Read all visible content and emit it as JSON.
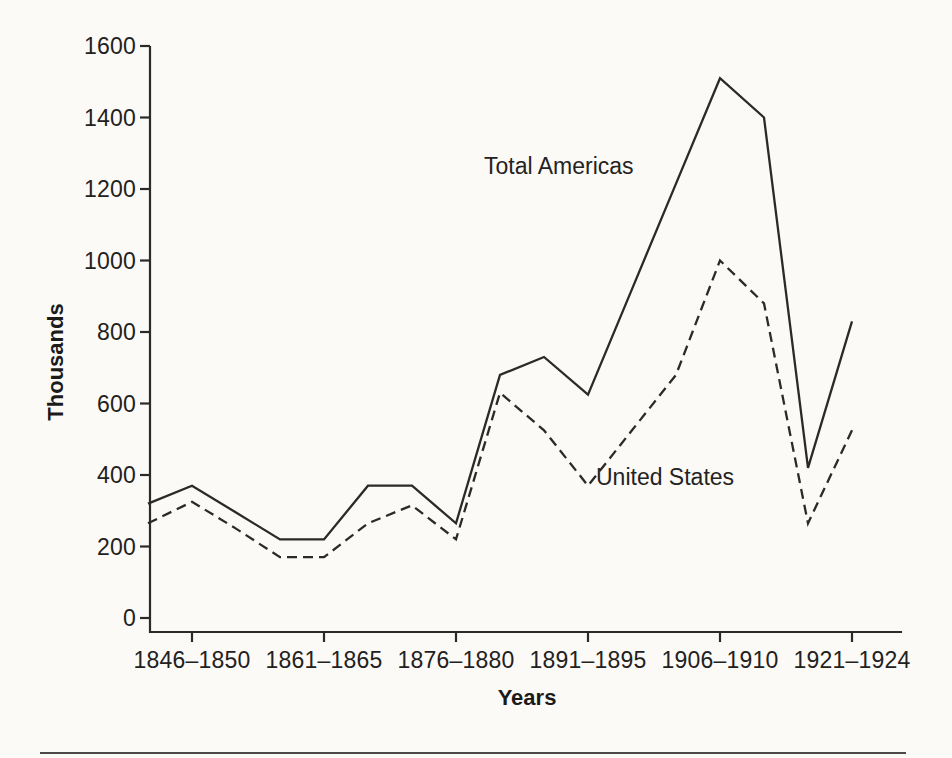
{
  "page": {
    "paper_color": "#fbfaf7",
    "ink_color": "#2b2a28",
    "divider_color": "#4a4947"
  },
  "chart_data": {
    "type": "line",
    "title": "",
    "xlabel": "Years",
    "ylabel": "Thousands",
    "ylim": [
      0,
      1600
    ],
    "grid": false,
    "legend": "inline-annotations",
    "y_ticks": [
      0,
      200,
      400,
      600,
      800,
      1000,
      1200,
      1400,
      1600
    ],
    "categories": [
      "1841–1845",
      "1846–1850",
      "1851–1855",
      "1856–1860",
      "1861–1865",
      "1866–1870",
      "1871–1875",
      "1876–1880",
      "1881–1885",
      "1886–1890",
      "1891–1895",
      "1896–1900",
      "1901–1905",
      "1906–1910",
      "1911–1915",
      "1916–1920",
      "1921–1924"
    ],
    "x_tick_indices": [
      1,
      4,
      7,
      10,
      13,
      16
    ],
    "x_tick_labels": [
      "1846–1850",
      "1861–1865",
      "1876–1880",
      "1891–1895",
      "1906–1910",
      "1921–1924"
    ],
    "series": [
      {
        "name": "Total Americas",
        "style": "solid",
        "color": "#2b2a28",
        "values": [
          320,
          370,
          295,
          220,
          220,
          370,
          370,
          265,
          680,
          730,
          625,
          920,
          1215,
          1510,
          1400,
          420,
          830
        ]
      },
      {
        "name": "United States",
        "style": "dashed",
        "color": "#2b2a28",
        "values": [
          265,
          325,
          250,
          170,
          170,
          265,
          315,
          220,
          630,
          525,
          370,
          525,
          680,
          1000,
          880,
          265,
          525
        ]
      }
    ]
  }
}
